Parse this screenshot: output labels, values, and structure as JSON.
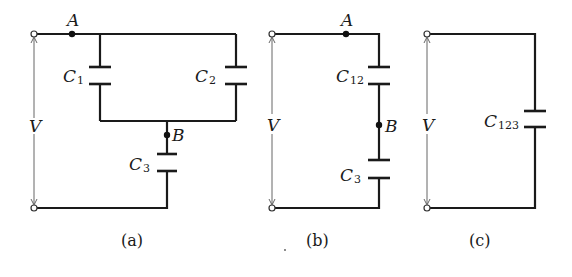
{
  "figure": {
    "panels": [
      {
        "id": "a",
        "caption": "(a)",
        "voltage_label": "V",
        "nodes": {
          "A": "A",
          "B": "B"
        },
        "capacitors": [
          {
            "base": "C",
            "sub": "1"
          },
          {
            "base": "C",
            "sub": "2"
          },
          {
            "base": "C",
            "sub": "3"
          }
        ]
      },
      {
        "id": "b",
        "caption": "(b)",
        "voltage_label": "V",
        "nodes": {
          "A": "A",
          "B": "B"
        },
        "capacitors": [
          {
            "base": "C",
            "sub": "12"
          },
          {
            "base": "C",
            "sub": "3"
          }
        ]
      },
      {
        "id": "c",
        "caption": "(c)",
        "voltage_label": "V",
        "capacitors": [
          {
            "base": "C",
            "sub": "123"
          }
        ]
      }
    ],
    "colors": {
      "wire": "#1a1a1a",
      "dimension_line": "#555555",
      "background": "#ffffff"
    }
  }
}
